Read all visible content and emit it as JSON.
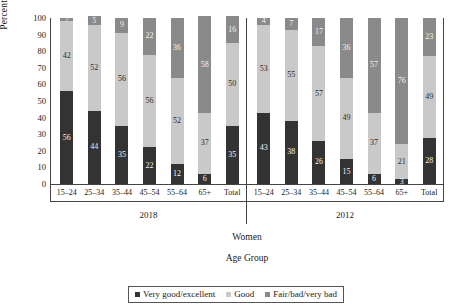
{
  "axis": {
    "ylabel": "Percentage",
    "yticks": [
      "0",
      "10",
      "20",
      "30",
      "40",
      "50",
      "60",
      "70",
      "80",
      "90",
      "100"
    ],
    "xlabel": "Age Group",
    "supergroup": "Women"
  },
  "groups": [
    {
      "label": "2018"
    },
    {
      "label": "2012"
    }
  ],
  "legend": [
    {
      "label": "Very good/excellent",
      "color": "#333333"
    },
    {
      "label": "Good",
      "color": "#c9c9c9"
    },
    {
      "label": "Fair/bad/very bad",
      "color": "#8a8a8a"
    }
  ],
  "chart_data": {
    "type": "bar",
    "title": "",
    "subtitle": "",
    "xlabel": "Age Group",
    "ylabel": "Percentage",
    "ylim": [
      0,
      100
    ],
    "yticks": [
      0,
      10,
      20,
      30,
      40,
      50,
      60,
      70,
      80,
      90,
      100
    ],
    "grid": false,
    "stacked": true,
    "stack_total": 100,
    "legend_position": "bottom",
    "panel_variable": "Year",
    "panels": [
      "2018",
      "2012"
    ],
    "supergroup": "Women",
    "categories": [
      "15–24",
      "25–34",
      "35–44",
      "45–54",
      "55–64",
      "65+",
      "Total"
    ],
    "series": [
      {
        "name": "Very good/excellent",
        "color": "#333333",
        "values_2018": [
          56,
          44,
          35,
          22,
          12,
          6,
          35
        ],
        "values_2012": [
          43,
          38,
          26,
          15,
          6,
          3,
          28
        ]
      },
      {
        "name": "Good",
        "color": "#c9c9c9",
        "values_2018": [
          42,
          52,
          56,
          56,
          52,
          37,
          50
        ],
        "values_2012": [
          53,
          55,
          57,
          49,
          37,
          21,
          49
        ]
      },
      {
        "name": "Fair/bad/very bad",
        "color": "#8a8a8a",
        "values_2018": [
          2,
          5,
          9,
          22,
          36,
          58,
          16
        ],
        "values_2012": [
          4,
          7,
          17,
          36,
          57,
          76,
          23
        ]
      }
    ]
  }
}
